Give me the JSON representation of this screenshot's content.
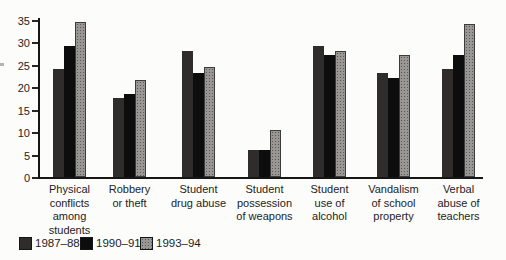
{
  "chart_data": {
    "type": "bar",
    "title": "",
    "xlabel": "",
    "ylabel": "",
    "ylim": [
      0,
      35
    ],
    "yticks": [
      0,
      5,
      10,
      15,
      20,
      25,
      30,
      35
    ],
    "grid": false,
    "legend_position": "bottom-left",
    "categories": [
      "Physical\nconflicts\namong\nstudents",
      "Robbery\nor theft",
      "Student\ndrug abuse",
      "Student\npossession\nof weapons",
      "Student\nuse of\nalcohol",
      "Vandalism\nof school\nproperty",
      "Verbal\nabuse of\nteachers"
    ],
    "series": [
      {
        "name": "1987–88",
        "color": "#2f2d2b",
        "values": [
          24,
          17.5,
          28,
          6,
          29,
          23,
          24
        ]
      },
      {
        "name": "1990–91",
        "color": "#0d0d0d",
        "values": [
          29,
          18.5,
          23,
          6,
          27,
          22,
          27
        ]
      },
      {
        "name": "1993–94",
        "color": "#999793",
        "pattern": "halftone-dots",
        "values": [
          34.5,
          21.5,
          24.5,
          10.5,
          28,
          27,
          34
        ]
      }
    ]
  },
  "colors": {
    "axis": "#161616",
    "text": "#232323",
    "background": "#fcfcfb"
  }
}
